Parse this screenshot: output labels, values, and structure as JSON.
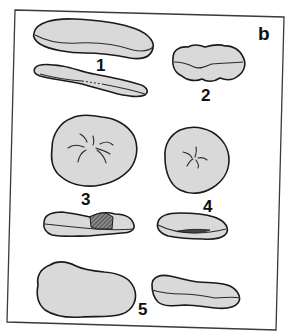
{
  "figure": {
    "panel_label": "b",
    "style": {
      "fill_color": "#d9d9d9",
      "outline_color": "#1a1a1a",
      "frame_color": "#3a3a3a",
      "background": "#ffffff"
    },
    "specimens": [
      {
        "id": "1",
        "label": "1",
        "views": [
          "elongated flattened top view",
          "elongated side view with dashed mid-line"
        ]
      },
      {
        "id": "2",
        "label": "2",
        "views": [
          "oval lobed view with wavy mid-line"
        ]
      },
      {
        "id": "3",
        "label": "3",
        "views": [
          "rounded view with radiating furrows",
          "side view with hatched region"
        ]
      },
      {
        "id": "4",
        "label": "4",
        "views": [
          "rounded view with small radiating furrows",
          "side view with dark central slit"
        ]
      },
      {
        "id": "5",
        "label": "5",
        "views": [
          "large kidney-shaped view",
          "elongated side view with wavy mid-line"
        ]
      }
    ]
  }
}
